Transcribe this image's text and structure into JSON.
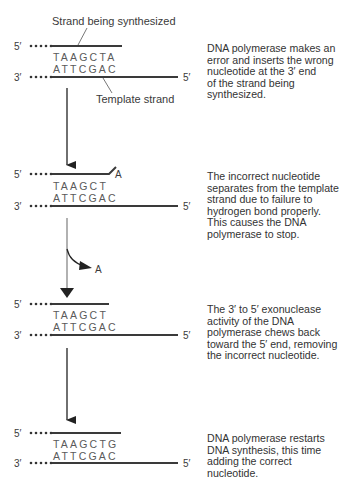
{
  "colors": {
    "strand": "#3a3a3a",
    "text": "#333333",
    "sequence": "#5a5a5a",
    "arrow_gray": "#888888"
  },
  "labels": {
    "strand_being_synthesized": "Strand being synthesized",
    "template_strand": "Template strand",
    "five_prime": "5′",
    "three_prime": "3′",
    "removed_nucleotide": "A"
  },
  "steps": [
    {
      "top_sequence": "TAAGCTA",
      "bottom_sequence": "ATTCGAC",
      "description": "DNA polymerase makes an\nerror and inserts the wrong\nnucleotide at the 3′ end\nof the strand being\nsynthesized."
    },
    {
      "top_sequence": "TAAGCT",
      "bottom_sequence": "ATTCGAC",
      "mismatch": "A",
      "description": "The incorrect nucleotide\nseparates from the template\nstrand due to failure to\nhydrogen bond properly.\nThis causes the DNA\npolymerase to stop."
    },
    {
      "top_sequence": "TAAGCT",
      "bottom_sequence": "ATTCGAC",
      "description": "The 3′ to 5′ exonuclease\nactivity of the DNA\npolymerase chews back\ntoward the 5′ end, removing\nthe incorrect nucleotide."
    },
    {
      "top_sequence": "TAAGCTG",
      "bottom_sequence": "ATTCGAC",
      "description": "DNA polymerase restarts\nDNA synthesis, this time\nadding the correct\nnucleotide."
    }
  ]
}
